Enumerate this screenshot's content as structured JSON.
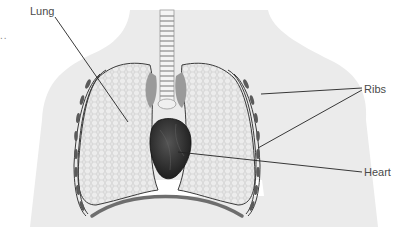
{
  "diagram": {
    "labels": {
      "lung": "Lung",
      "ribs": "Ribs",
      "heart": "Heart"
    },
    "ellipsis": "..",
    "colors": {
      "body_silhouette": "#ebebeb",
      "lung_fill": "#e2e2e2",
      "lung_outline": "#3a3a3a",
      "heart": "#2e2e2e",
      "leader_line": "#222222",
      "label_text": "#4a4a4a",
      "bronchi": "#9a9a9a",
      "diaphragm": "#6e6e6e"
    }
  }
}
